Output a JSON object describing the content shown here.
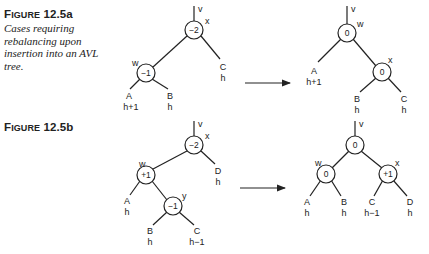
{
  "figures": [
    {
      "id_label": "Figure 12.5a",
      "title_first": "F",
      "title_rest": "IGURE",
      "title_num": "12.5a",
      "description": "Cases requiring rebalancing upon insertion into an AVL tree.",
      "before": {
        "root_pointer": "v",
        "nodes": [
          {
            "name": "x",
            "balance": "−2"
          },
          {
            "name": "w",
            "balance": "−1"
          }
        ],
        "subtrees": [
          {
            "name": "A",
            "height": "h+1"
          },
          {
            "name": "B",
            "height": "h"
          },
          {
            "name": "C",
            "height": "h"
          }
        ]
      },
      "after": {
        "root_pointer": "v",
        "nodes": [
          {
            "name": "w",
            "balance": "0"
          },
          {
            "name": "x",
            "balance": "0"
          }
        ],
        "subtrees": [
          {
            "name": "A",
            "height": "h+1"
          },
          {
            "name": "B",
            "height": "h"
          },
          {
            "name": "C",
            "height": "h"
          }
        ]
      }
    },
    {
      "id_label": "Figure 12.5b",
      "title_first": "F",
      "title_rest": "IGURE",
      "title_num": "12.5b",
      "before": {
        "root_pointer": "v",
        "nodes": [
          {
            "name": "x",
            "balance": "−2"
          },
          {
            "name": "w",
            "balance": "+1"
          },
          {
            "name": "y",
            "balance": "−1"
          }
        ],
        "subtrees": [
          {
            "name": "A",
            "height": "h"
          },
          {
            "name": "B",
            "height": "h"
          },
          {
            "name": "C",
            "height": "h−1"
          },
          {
            "name": "D",
            "height": "h"
          }
        ]
      },
      "after": {
        "root_pointer": "v",
        "nodes": [
          {
            "name": "y",
            "balance": "0"
          },
          {
            "name": "w",
            "balance": "0"
          },
          {
            "name": "x",
            "balance": "+1"
          }
        ],
        "subtrees": [
          {
            "name": "A",
            "height": "h"
          },
          {
            "name": "B",
            "height": "h"
          },
          {
            "name": "C",
            "height": "h−1"
          },
          {
            "name": "D",
            "height": "h"
          }
        ]
      }
    }
  ],
  "colors": {
    "ink": "#222222",
    "background": "#ffffff"
  }
}
